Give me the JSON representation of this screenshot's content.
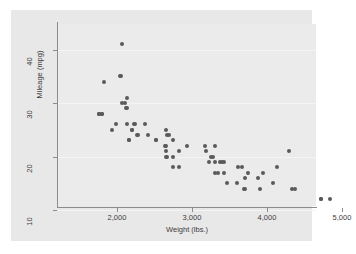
{
  "chart_data": {
    "type": "scatter",
    "title": "",
    "xlabel": "Weight (lbs.)",
    "ylabel": "Mileage (mpg)",
    "xlim": [
      1670,
      4990
    ],
    "ylim": [
      9.0,
      42.5
    ],
    "xticks": [
      2000,
      3000,
      4000,
      5000
    ],
    "xticklabels": [
      "2,000",
      "3,000",
      "4,000",
      "5,000"
    ],
    "yticks": [
      10,
      20,
      30,
      40
    ],
    "yticklabels": [
      "10",
      "20",
      "30",
      "40"
    ],
    "grid": "horizontal-faint",
    "legend": "none",
    "marker_color": "#5a5a5a",
    "plot_background": "#ebebeb",
    "canvas_background": "#e8e8e8",
    "axis_color": "#8c8c8c",
    "series": [
      {
        "name": "Mileage vs Weight",
        "x": [
          2930,
          3350,
          2640,
          3250,
          4080,
          3670,
          2230,
          3280,
          3880,
          3400,
          3310,
          3690,
          3180,
          3220,
          4330,
          3900,
          4290,
          4720,
          3370,
          4130,
          4370,
          4840,
          4720,
          3700,
          3950,
          3470,
          2830,
          2260,
          3310,
          3310,
          2200,
          2520,
          2130,
          2650,
          1800,
          2690,
          2110,
          3700,
          2750,
          2280,
          2750,
          2120,
          2670,
          3170,
          3600,
          3740,
          3430,
          3610,
          2050,
          2410,
          2200,
          2520,
          2240,
          2750,
          2130,
          2650,
          1760,
          2830,
          2070,
          1930,
          1990,
          2160,
          2670,
          1830,
          2040,
          2370,
          2130,
          2650,
          1760,
          2070,
          2160,
          2650,
          1800,
          3420
        ],
        "y": [
          22,
          17,
          22,
          20,
          15,
          18,
          26,
          20,
          16,
          19,
          19,
          14,
          21,
          19,
          14,
          14,
          21,
          12,
          19,
          18,
          14,
          12,
          12,
          16,
          17,
          15,
          18,
          24,
          22,
          17,
          25,
          23,
          26,
          21,
          28,
          24,
          30,
          14,
          23,
          24,
          18,
          29,
          20,
          22,
          15,
          17,
          17,
          18,
          35,
          24,
          25,
          23,
          26,
          20,
          31,
          25,
          28,
          21,
          30,
          25,
          26,
          23,
          24,
          34,
          35,
          26,
          29,
          20,
          28,
          41,
          23,
          22,
          28,
          19
        ]
      }
    ]
  },
  "axis": {
    "x_title": "Weight (lbs.)",
    "y_title": "Mileage (mpg)"
  }
}
